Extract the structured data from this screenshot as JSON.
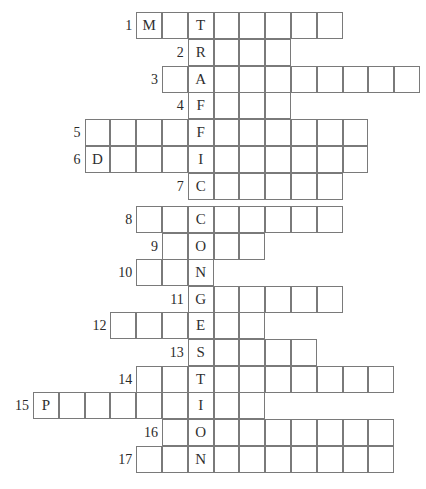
{
  "puzzle": {
    "title": "",
    "key_word": "TRAFFIC CONGESTION",
    "grid": {
      "origin_x": 33,
      "cell_width": 25.8,
      "cell_height": 26.7,
      "key_column": 6,
      "line_color": "#7a7a7a",
      "text_color": "#2f2f2f"
    },
    "rows": [
      {
        "num": "1",
        "y": 12,
        "start_col": 4,
        "cells": [
          "M",
          "",
          "T",
          "",
          "",
          "",
          "",
          ""
        ]
      },
      {
        "num": "2",
        "y": 39,
        "start_col": 6,
        "cells": [
          "R",
          "",
          "",
          ""
        ]
      },
      {
        "num": "3",
        "y": 66,
        "start_col": 5,
        "cells": [
          "",
          "A",
          "",
          "",
          "",
          "",
          "",
          "",
          "",
          ""
        ]
      },
      {
        "num": "4",
        "y": 92,
        "start_col": 6,
        "cells": [
          "F",
          "",
          "",
          ""
        ]
      },
      {
        "num": "5",
        "y": 119,
        "start_col": 2,
        "cells": [
          "",
          "",
          "",
          "",
          "F",
          "",
          "",
          "",
          "",
          "",
          ""
        ]
      },
      {
        "num": "6",
        "y": 146,
        "start_col": 2,
        "cells": [
          "D",
          "",
          "",
          "",
          "I",
          "",
          "",
          "",
          "",
          "",
          ""
        ]
      },
      {
        "num": "7",
        "y": 173,
        "start_col": 6,
        "cells": [
          "C",
          "",
          "",
          "",
          "",
          ""
        ]
      },
      {
        "num": "8",
        "y": 206,
        "start_col": 4,
        "cells": [
          "",
          "",
          "C",
          "",
          "",
          "",
          "",
          ""
        ]
      },
      {
        "num": "9",
        "y": 233,
        "start_col": 5,
        "cells": [
          "",
          "O",
          "",
          ""
        ]
      },
      {
        "num": "10",
        "y": 259,
        "start_col": 4,
        "cells": [
          "",
          "",
          "N"
        ]
      },
      {
        "num": "11",
        "y": 286,
        "start_col": 6,
        "cells": [
          "G",
          "",
          "",
          "",
          "",
          ""
        ]
      },
      {
        "num": "12",
        "y": 312,
        "start_col": 3,
        "cells": [
          "",
          "",
          "",
          "E",
          "",
          ""
        ]
      },
      {
        "num": "13",
        "y": 339,
        "start_col": 6,
        "cells": [
          "S",
          "",
          "",
          "",
          ""
        ]
      },
      {
        "num": "14",
        "y": 366,
        "start_col": 4,
        "cells": [
          "",
          "",
          "T",
          "",
          "",
          "",
          "",
          "",
          "",
          ""
        ]
      },
      {
        "num": "15",
        "y": 392,
        "start_col": 0,
        "cells": [
          "P",
          "",
          "",
          "",
          "",
          "",
          "I",
          "",
          ""
        ]
      },
      {
        "num": "16",
        "y": 419,
        "start_col": 5,
        "cells": [
          "",
          "O",
          "",
          "",
          "",
          "",
          "",
          "",
          ""
        ]
      },
      {
        "num": "17",
        "y": 446,
        "start_col": 4,
        "cells": [
          "",
          "",
          "N",
          "",
          "",
          "",
          "",
          "",
          "",
          ""
        ]
      }
    ]
  }
}
